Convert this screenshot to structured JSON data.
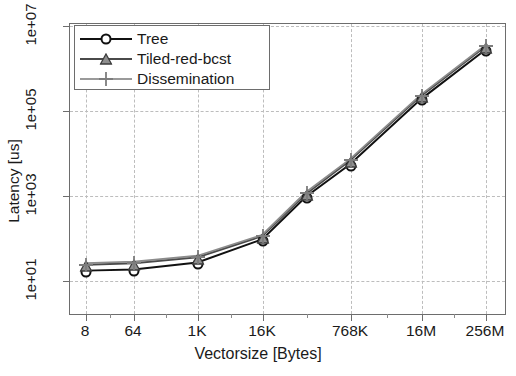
{
  "chart_data": {
    "type": "line",
    "title": "",
    "xlabel": "Vectorsize [Bytes]",
    "ylabel": "Latency [us]",
    "xscale": "log2",
    "yscale": "log10",
    "grid": true,
    "legend_position": "top-left",
    "xtick_labels": [
      "8",
      "64",
      "1K",
      "16K",
      "768K",
      "16M",
      "256M"
    ],
    "ytick_labels": [
      "1e+01",
      "1e+03",
      "1e+05",
      "1e+07"
    ],
    "ylim": [
      1,
      100000000
    ],
    "x": [
      "8",
      "64",
      "1K",
      "16K",
      "128K",
      "768K",
      "16M",
      "256M"
    ],
    "series": [
      {
        "name": "Tree",
        "marker": "circle-icon",
        "color": "#111111",
        "values": [
          16,
          17,
          25,
          88,
          900,
          5200,
          180000,
          2600000
        ]
      },
      {
        "name": "Tiled-red-bcst",
        "marker": "triangle-icon",
        "color": "#4a4a4a",
        "values": [
          22,
          24,
          33,
          105,
          1050,
          6400,
          215000,
          3100000
        ]
      },
      {
        "name": "Dissemination",
        "marker": "plus-icon",
        "color": "#8c8c8c",
        "values": [
          24,
          26,
          36,
          112,
          1150,
          6900,
          230000,
          3300000
        ]
      }
    ]
  },
  "axes": {
    "x_title": "Vectorsize [Bytes]",
    "y_title": "Latency [us]"
  },
  "legend": {
    "entries": [
      {
        "label": "Tree"
      },
      {
        "label": "Tiled-red-bcst"
      },
      {
        "label": "Dissemination"
      }
    ]
  }
}
